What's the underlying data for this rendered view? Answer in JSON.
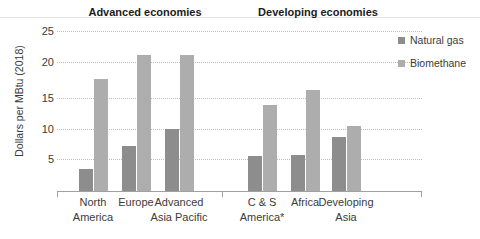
{
  "chart_data": {
    "type": "bar",
    "title": "",
    "xlabel": "",
    "ylabel": "Dollars per MBtu (2018)",
    "ylim": [
      0,
      25
    ],
    "yticks": [
      5,
      10,
      15,
      20,
      25
    ],
    "ytick_labels": [
      "5",
      "10",
      "15",
      "20",
      "25"
    ],
    "grid": true,
    "legend_position": "right",
    "categories": [
      "North America",
      "Europe",
      "Advanced Asia Pacific",
      "C & S America*",
      "Africa",
      "Developing Asia"
    ],
    "series": [
      {
        "name": "Natural gas",
        "color": "#8d8d8d",
        "values": [
          3.5,
          7.3,
          9.9,
          5.6,
          5.8,
          8.7
        ]
      },
      {
        "name": "Biomethane",
        "color": "#adadad",
        "values": [
          18.0,
          21.8,
          21.9,
          13.9,
          16.3,
          10.5
        ]
      }
    ],
    "groups": [
      {
        "label": "Advanced economies",
        "categories": [
          "North America",
          "Europe",
          "Advanced Asia Pacific"
        ]
      },
      {
        "label": "Developing economies",
        "categories": [
          "C & S America*",
          "Africa",
          "Developing Asia"
        ]
      }
    ],
    "annotations": [
      "*"
    ]
  },
  "axis": {
    "y_title": "Dollars per MBtu (2018)",
    "tick_labels": [
      "25",
      "20",
      "15",
      "10",
      "5"
    ]
  },
  "groups": {
    "advanced_label": "Advanced economies",
    "developing_label": "Developing economies"
  },
  "categories": [
    {
      "line1": "North",
      "line2": "America"
    },
    {
      "line1": "Europe",
      "line2": ""
    },
    {
      "line1": "Advanced",
      "line2": "Asia Pacific"
    },
    {
      "line1": "C & S",
      "line2": "America*"
    },
    {
      "line1": "Africa",
      "line2": ""
    },
    {
      "line1": "Developing",
      "line2": "Asia"
    }
  ],
  "legend": {
    "items": [
      {
        "label": "Natural gas",
        "color": "#8d8d8d"
      },
      {
        "label": "Biomethane",
        "color": "#adadad"
      }
    ]
  }
}
